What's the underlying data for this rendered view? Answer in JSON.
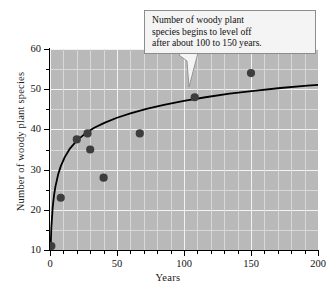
{
  "chart_data": {
    "type": "scatter",
    "title": "",
    "xlabel": "Years",
    "ylabel": "Number of woody plant species",
    "xlim": [
      0,
      200
    ],
    "ylim": [
      10,
      60
    ],
    "xticks": [
      0,
      50,
      100,
      150,
      200
    ],
    "yticks": [
      10,
      20,
      30,
      40,
      50,
      60
    ],
    "xtick_labels": [
      "0",
      "50",
      "100",
      "150",
      "200"
    ],
    "ytick_labels": [
      "10",
      "20",
      "30",
      "40",
      "50",
      "60"
    ],
    "x_minor_step": 10,
    "y_minor_step": 5,
    "grid": true,
    "legend": "none",
    "points": [
      {
        "x": 1,
        "y": 11
      },
      {
        "x": 8,
        "y": 23
      },
      {
        "x": 20,
        "y": 37.5
      },
      {
        "x": 28,
        "y": 39
      },
      {
        "x": 30,
        "y": 35
      },
      {
        "x": 40,
        "y": 28
      },
      {
        "x": 67,
        "y": 39
      },
      {
        "x": 108,
        "y": 48
      },
      {
        "x": 150,
        "y": 54
      }
    ],
    "series": [
      {
        "name": "fitted logarithmic curve",
        "type": "line",
        "x": [
          0.4,
          1,
          2,
          3,
          4,
          6,
          8,
          11,
          15,
          20,
          26,
          33,
          41,
          50,
          60,
          72,
          85,
          100,
          116,
          134,
          152,
          172,
          192,
          200
        ],
        "y": [
          10.2,
          15.5,
          20.6,
          23.6,
          25.7,
          28.7,
          30.8,
          33.1,
          35.3,
          37.2,
          38.9,
          40.4,
          41.7,
          42.9,
          44.0,
          45.1,
          46.1,
          47.1,
          48.0,
          48.9,
          49.6,
          50.3,
          50.9,
          51.1
        ]
      }
    ],
    "annotations": [
      {
        "text": "Number of woody plant species begins to level off after about 100 to 150 years.",
        "lines": [
          "Number of woody plant",
          "species begins to level off",
          "after about 100 to 150 years."
        ],
        "points_to": {
          "x": 108,
          "y": 48
        }
      }
    ],
    "colors": {
      "plot_background": "#b9b9b9",
      "gridline": "#f2f2f2",
      "point": "#3d3d3d",
      "curve": "#000000",
      "axis": "#000000",
      "callout_background": "#f4f4f4",
      "callout_border": "#8d8d8d"
    }
  }
}
